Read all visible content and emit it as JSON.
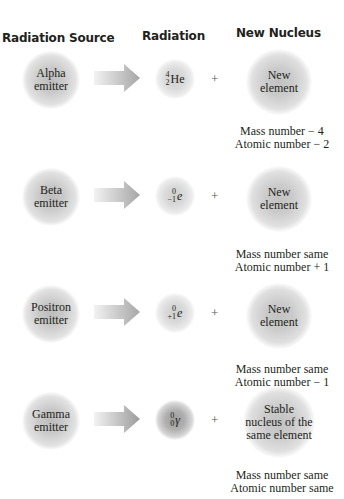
{
  "headers": {
    "source": "Radiation Source",
    "radiation": "Radiation",
    "nucleus": "New Nucleus"
  },
  "plus_sign": "+",
  "rows": [
    {
      "source": [
        "Alpha",
        "emitter"
      ],
      "radiation": {
        "mass": "4",
        "atomic": "2",
        "symbol": "He",
        "italic": false
      },
      "nucleus": [
        "New",
        "element"
      ],
      "notes": [
        "Mass number − 4",
        "Atomic number − 2"
      ]
    },
    {
      "source": [
        "Beta",
        "emitter"
      ],
      "radiation": {
        "mass": "0",
        "atomic": "−1",
        "symbol": "e",
        "italic": true
      },
      "nucleus": [
        "New",
        "element"
      ],
      "notes": [
        "Mass number same",
        "Atomic number + 1"
      ]
    },
    {
      "source": [
        "Positron",
        "emitter"
      ],
      "radiation": {
        "mass": "0",
        "atomic": "+1",
        "symbol": "e",
        "italic": true
      },
      "nucleus": [
        "New",
        "element"
      ],
      "notes": [
        "Mass number same",
        "Atomic number − 1"
      ]
    },
    {
      "source": [
        "Gamma",
        "emitter"
      ],
      "radiation": {
        "mass": "0",
        "atomic": "0",
        "symbol": "γ",
        "italic": true
      },
      "nucleus": [
        "Stable",
        "nucleus of the",
        "same element"
      ],
      "notes": [
        "Mass number same",
        "Atomic number same"
      ]
    }
  ],
  "colors": {
    "text": "#231f20",
    "arrow_start": "#f0f0f0",
    "arrow_end": "#a8a8a8"
  }
}
